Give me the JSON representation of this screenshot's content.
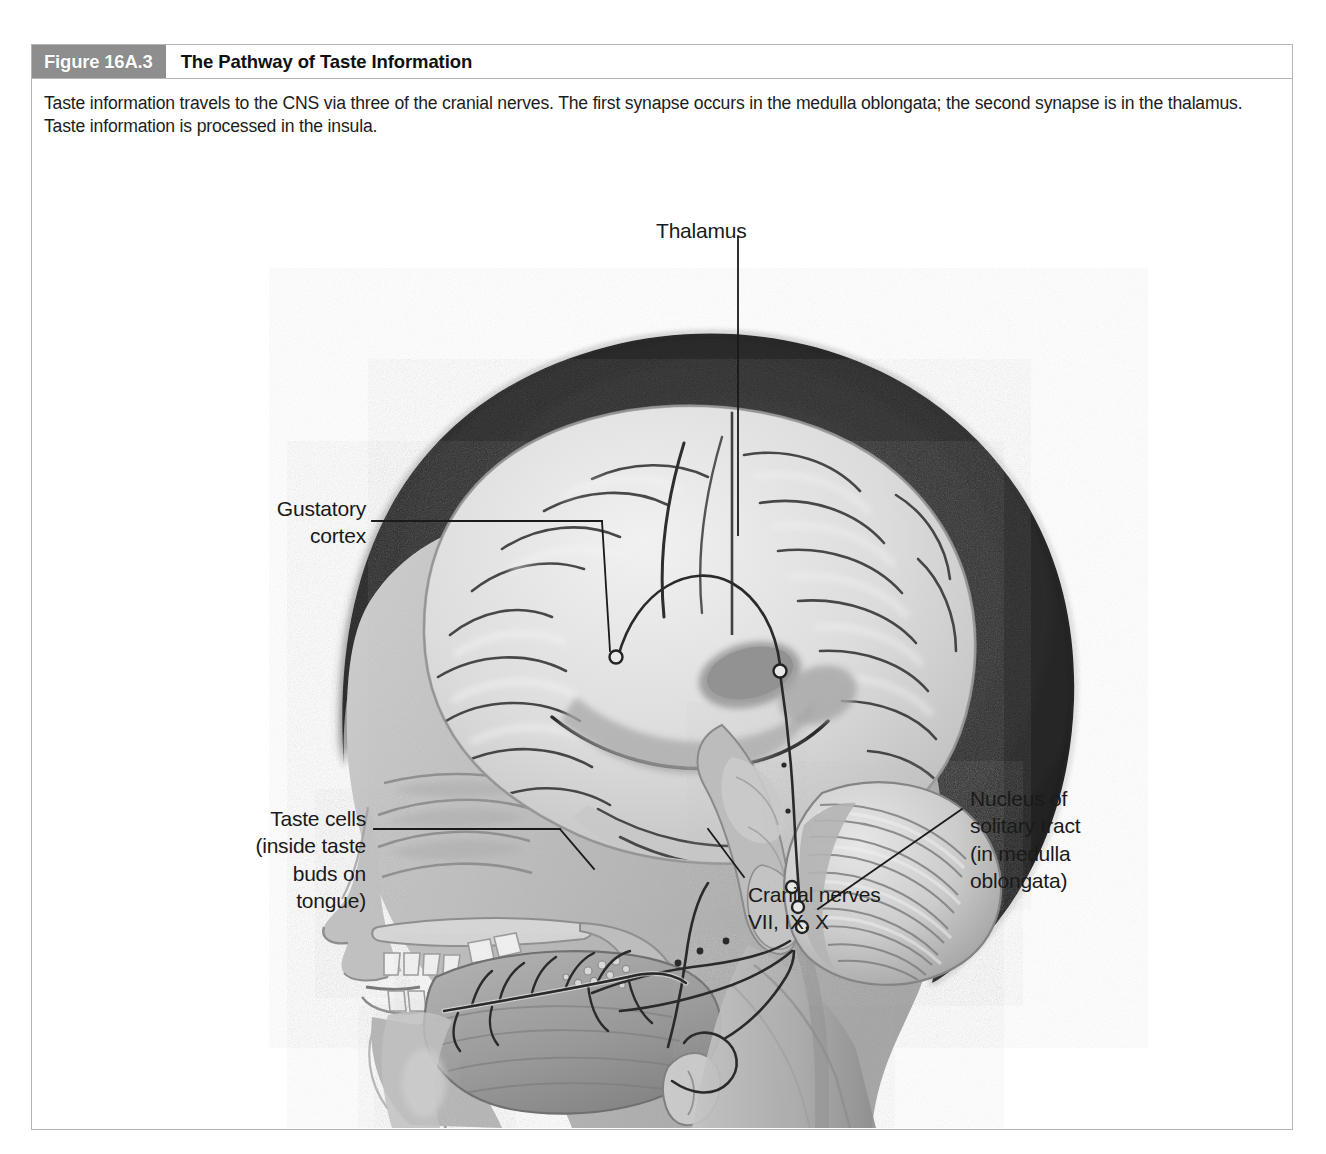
{
  "figure": {
    "number_label": "Figure 16A.3",
    "title": "The Pathway of Taste Information",
    "caption": "Taste information travels to the CNS via three of the cranial nerves. The first synapse occurs in the medulla oblongata; the second synapse is in the thalamus. Taste information is processed in the insula."
  },
  "colors": {
    "number_badge_bg": "#8e8e8e",
    "number_badge_text": "#ffffff",
    "title_text": "#111111",
    "frame_border": "#b4b4b4",
    "label_text": "#1a1a1a",
    "leader_line": "#1a1a1a",
    "hair_dark": "#2b2b2b",
    "brain_light": "#e2e2e2",
    "skin_mid": "#b9b9b9",
    "cerebellum": "#c9c9c9",
    "tongue": "#9a9a9a",
    "page_background": "#ffffff"
  },
  "labels": {
    "thalamus": "Thalamus",
    "gustatory_cortex": "Gustatory\ncortex",
    "taste_cells": "Taste cells\n(inside taste\nbuds on\ntongue)",
    "cranial_nerves": "Cranial nerves\nVII, IX, X",
    "nucleus_solitary": "Nucleus of\nsolitary tract\n(in medulla\noblongata)"
  },
  "diagram": {
    "type": "anatomical-illustration",
    "structures": [
      "hair / scalp",
      "cerebral cortex with gyri and sulci",
      "thalamus",
      "insula / gustatory cortex",
      "cerebellum",
      "brainstem and medulla oblongata",
      "nasal cavity",
      "hard palate",
      "teeth",
      "tongue with taste buds",
      "epiglottis / larynx",
      "spinal cord"
    ],
    "pathway_steps": [
      "Taste cells in taste buds on tongue",
      "Cranial nerves VII, IX, X",
      "First synapse: nucleus of solitary tract (medulla oblongata)",
      "Second synapse: thalamus",
      "Processing: gustatory cortex (insula)"
    ],
    "synapse_markers": 5
  }
}
